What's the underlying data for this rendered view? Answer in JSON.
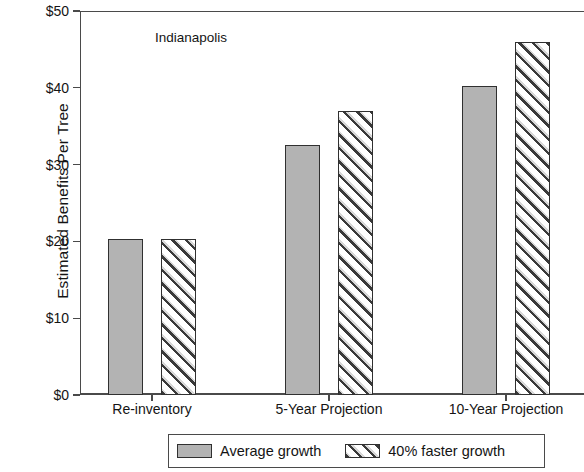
{
  "chart_data": {
    "type": "bar",
    "title": "",
    "annotation": "Indianapolis",
    "xlabel": "",
    "ylabel": "Estimated Benefits Per Tree",
    "categories": [
      "Re-inventory",
      "5-Year Projection",
      "10-Year Projection"
    ],
    "series": [
      {
        "name": "Average growth",
        "pattern": "solid-gray",
        "color": "#b3b3b3",
        "values": [
          20.3,
          32.6,
          40.3
        ]
      },
      {
        "name": "40% faster growth",
        "pattern": "diagonal-hatch",
        "color": "#ffffff",
        "values": [
          20.3,
          37.0,
          46.0
        ]
      }
    ],
    "ylim": [
      0,
      50
    ],
    "ytick_values": [
      0,
      10,
      20,
      30,
      40,
      50
    ],
    "ytick_labels": [
      "$0",
      "$10",
      "$20",
      "$30",
      "$40",
      "$50"
    ],
    "grid": false,
    "legend_position": "bottom-outside"
  },
  "legend": {
    "items": [
      {
        "label": "Average growth"
      },
      {
        "label": "40% faster growth"
      }
    ]
  }
}
